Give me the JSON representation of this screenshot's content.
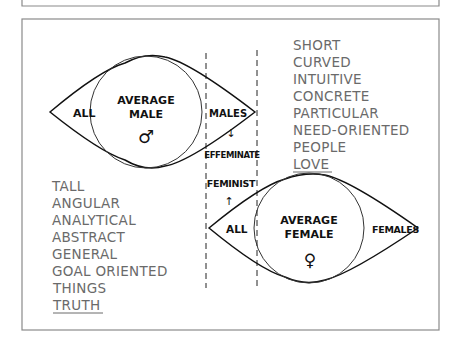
{
  "diagram": {
    "male_lens": {
      "left_label": "ALL",
      "center_label_line1": "AVERAGE",
      "center_label_line2": "MALE",
      "symbol": "♂",
      "right_label": "MALES"
    },
    "female_lens": {
      "left_label": "ALL",
      "center_label_line1": "AVERAGE",
      "center_label_line2": "FEMALE",
      "symbol": "♀",
      "right_label": "FEMALES"
    },
    "overlap_zone": {
      "upper_label": "EFFEMINATE",
      "upper_arrow": "↓",
      "lower_label": "FEMINIST",
      "lower_arrow": "↑"
    },
    "male_traits": [
      "TALL",
      "ANGULAR",
      "ANALYTICAL",
      "ABSTRACT",
      "GENERAL",
      "GOAL ORIENTED",
      "THINGS",
      "TRUTH"
    ],
    "female_traits": [
      "SHORT",
      "CURVED",
      "INTUITIVE",
      "CONCRETE",
      "PARTICULAR",
      "NEED-ORIENTED",
      "PEOPLE",
      "LOVE"
    ]
  },
  "colors": {
    "line": "#111111",
    "trait_text": "#6a6a6a",
    "frame": "#888888"
  }
}
